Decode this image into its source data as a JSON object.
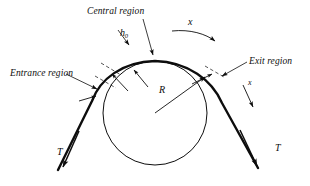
{
  "figure": {
    "type": "belt-pulley-mechanics-diagram",
    "background_color": "#ffffff",
    "ink_color": "#0d0d0d",
    "width": 310,
    "height": 186
  },
  "labels": {
    "central_region": "Central region",
    "entrance_region": "Entrance region",
    "exit_region": "Exit region",
    "belt_thickness": "h",
    "belt_thickness_subscript": "0",
    "coordinate_entry": "x",
    "coordinate_exit": "x",
    "radius": "R",
    "tension_left": "T",
    "tension_right": "T"
  },
  "geometry": {
    "pulley_center_x": 155,
    "pulley_center_y": 113,
    "pulley_radius": 52,
    "belt_stroke_width": 2.4,
    "pulley_stroke_width": 1.0,
    "leader_stroke_width": 0.8
  },
  "annotations": {
    "region_boundary_ticks": 3,
    "gap_arrows": 3,
    "tension_arrows": 2,
    "direction_arrows": 2,
    "radius_arrow": 1
  }
}
